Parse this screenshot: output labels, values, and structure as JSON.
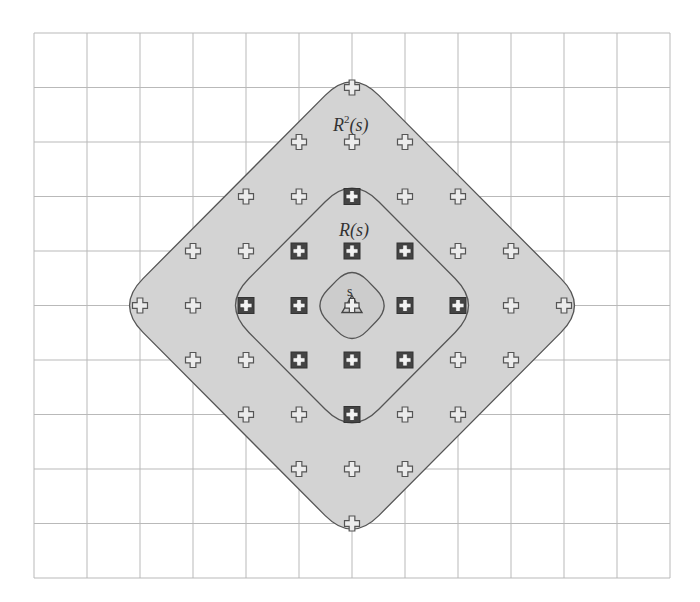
{
  "diagram": {
    "title": "",
    "grid": {
      "left": 34,
      "top": 33,
      "cols": 12,
      "rows": 10,
      "cell_w": 53,
      "cell_h": 54.5,
      "line_color": "#b9b9b9"
    },
    "origin": {
      "col": 6,
      "row": 5
    },
    "colors": {
      "region_fill": "#d3d3d3",
      "region_stroke": "#555555",
      "marker_stroke": "#555555",
      "boxed_marker_fill": "#444444"
    },
    "regions": [
      {
        "name": "R2(s)",
        "radius": 4,
        "label": "R",
        "label_sup": "2",
        "label_suffix": "(s)"
      },
      {
        "name": "R(s)",
        "radius": 2,
        "label": "R(s)"
      },
      {
        "name": "s",
        "radius": 0.7,
        "label": "s"
      }
    ],
    "labels": {
      "r2_main": "R",
      "r2_sup": "2",
      "r2_suffix": "(s)",
      "r1": "R(s)",
      "s": "s"
    },
    "points": {
      "center": {
        "x": 0,
        "y": 0,
        "marker": "triangle-cross"
      },
      "inner_boxed": [
        [
          0,
          -2
        ],
        [
          -1,
          -1
        ],
        [
          0,
          -1
        ],
        [
          1,
          -1
        ],
        [
          -2,
          0
        ],
        [
          -1,
          0
        ],
        [
          1,
          0
        ],
        [
          2,
          0
        ],
        [
          -1,
          1
        ],
        [
          0,
          1
        ],
        [
          1,
          1
        ],
        [
          0,
          2
        ]
      ],
      "outer_plain": [
        [
          0,
          -4
        ],
        [
          -1,
          -3
        ],
        [
          0,
          -3
        ],
        [
          1,
          -3
        ],
        [
          -2,
          -2
        ],
        [
          -1,
          -2
        ],
        [
          1,
          -2
        ],
        [
          2,
          -2
        ],
        [
          -3,
          -1
        ],
        [
          -2,
          -1
        ],
        [
          2,
          -1
        ],
        [
          3,
          -1
        ],
        [
          -4,
          0
        ],
        [
          -3,
          0
        ],
        [
          3,
          0
        ],
        [
          4,
          0
        ],
        [
          -3,
          1
        ],
        [
          -2,
          1
        ],
        [
          2,
          1
        ],
        [
          3,
          1
        ],
        [
          -2,
          2
        ],
        [
          -1,
          2
        ],
        [
          1,
          2
        ],
        [
          2,
          2
        ],
        [
          -1,
          3
        ],
        [
          0,
          3
        ],
        [
          1,
          3
        ],
        [
          0,
          4
        ]
      ]
    }
  }
}
